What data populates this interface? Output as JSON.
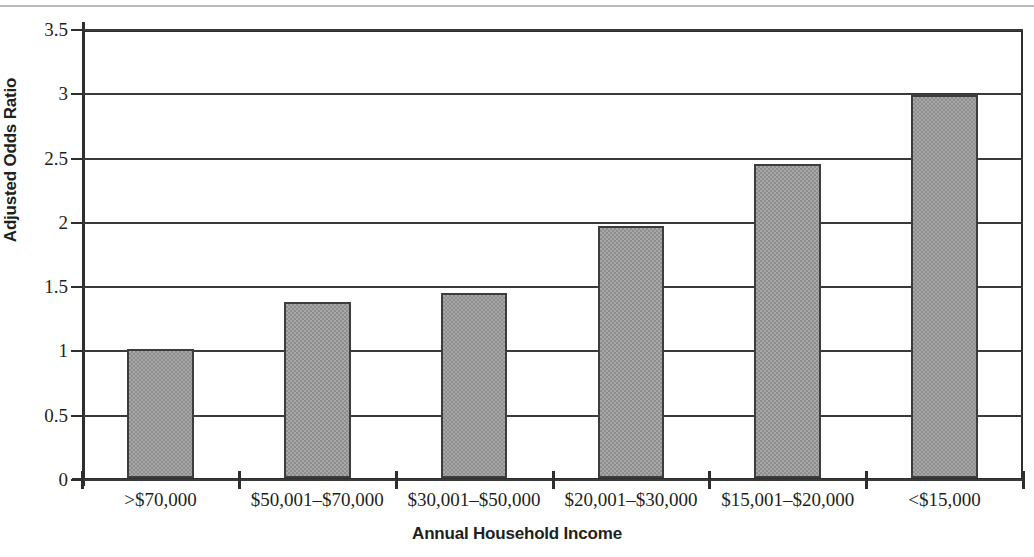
{
  "chart_data": {
    "type": "bar",
    "title": "",
    "subtitle": "",
    "xlabel": "Annual Household Income",
    "ylabel": "Adjusted Odds Ratio",
    "categories": [
      ">$70,000",
      "$50,001–$70,000",
      "$30,001–$50,000",
      "$20,001–$30,000",
      "$15,001–$20,000",
      "<$15,000"
    ],
    "values": [
      1.0,
      1.37,
      1.44,
      1.96,
      2.44,
      2.98
    ],
    "ylim": [
      0,
      3.5
    ],
    "yticks": [
      0,
      0.5,
      1,
      1.5,
      2,
      2.5,
      3,
      3.5
    ],
    "ytick_labels": [
      "0",
      "0.5",
      "1",
      "1.5",
      "2",
      "2.5",
      "3",
      "3.5"
    ],
    "grid": true,
    "legend": false,
    "legend_position": "none",
    "series": [
      {
        "name": "Adjusted Odds Ratio",
        "values": [
          1.0,
          1.37,
          1.44,
          1.96,
          2.44,
          2.98
        ]
      }
    ],
    "colors": {
      "bar_fill": "#a8a8a8",
      "bar_pattern": "#8d8d8d",
      "bar_edge": "#3d3d3d",
      "axis": "#2e2e2e",
      "grid": "#3a3a3a",
      "text": "#231f20",
      "background": "#ffffff"
    }
  }
}
